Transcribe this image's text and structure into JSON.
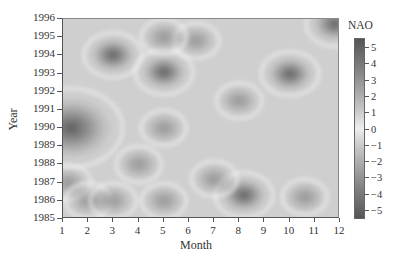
{
  "chart_data": {
    "type": "heatmap",
    "title": "",
    "xlabel": "Month",
    "ylabel": "Year",
    "x_ticks": [
      "1",
      "2",
      "3",
      "4",
      "5",
      "6",
      "7",
      "8",
      "9",
      "10",
      "11",
      "12"
    ],
    "y_ticks": [
      "1985",
      "1986",
      "1987",
      "1988",
      "1989",
      "1990",
      "1991",
      "1992",
      "1993",
      "1994",
      "1995",
      "1996"
    ],
    "xlim": [
      1,
      12
    ],
    "ylim": [
      1985,
      1996
    ],
    "colorbar": {
      "label": "NAO",
      "ticks": [
        "5",
        "4",
        "3",
        "2",
        "1",
        "0",
        "−1",
        "−2",
        "−3",
        "−4",
        "−5"
      ],
      "range": [
        -5,
        5
      ],
      "colormap": "gray-diverging (dark at extremes, light at 0)"
    },
    "features": [
      {
        "month": 1.3,
        "year": 1990.0,
        "intensity": "dark",
        "note": "broad low region months 1-2, 1989-1991"
      },
      {
        "month": 3.0,
        "year": 1994.0,
        "intensity": "dark"
      },
      {
        "month": 5.0,
        "year": 1993.1,
        "intensity": "dark"
      },
      {
        "month": 5.0,
        "year": 1990.0,
        "intensity": "medium"
      },
      {
        "month": 4.0,
        "year": 1988.0,
        "intensity": "medium"
      },
      {
        "month": 1.2,
        "year": 1987.0,
        "intensity": "medium"
      },
      {
        "month": 2.0,
        "year": 1986.0,
        "intensity": "medium"
      },
      {
        "month": 3.0,
        "year": 1986.0,
        "intensity": "medium"
      },
      {
        "month": 5.0,
        "year": 1986.0,
        "intensity": "medium"
      },
      {
        "month": 8.2,
        "year": 1986.3,
        "intensity": "dark"
      },
      {
        "month": 10.6,
        "year": 1986.2,
        "intensity": "medium"
      },
      {
        "month": 10.0,
        "year": 1993.0,
        "intensity": "dark"
      },
      {
        "month": 8.0,
        "year": 1991.5,
        "intensity": "medium"
      },
      {
        "month": 11.8,
        "year": 1995.7,
        "intensity": "dark"
      },
      {
        "month": 6.3,
        "year": 1994.8,
        "intensity": "medium"
      },
      {
        "month": 7.0,
        "year": 1987.2,
        "intensity": "medium"
      },
      {
        "month": 5.0,
        "year": 1995.0,
        "intensity": "medium"
      }
    ]
  },
  "labels": {
    "xlabel": "Month",
    "ylabel": "Year",
    "colorbar_title": "NAO"
  }
}
